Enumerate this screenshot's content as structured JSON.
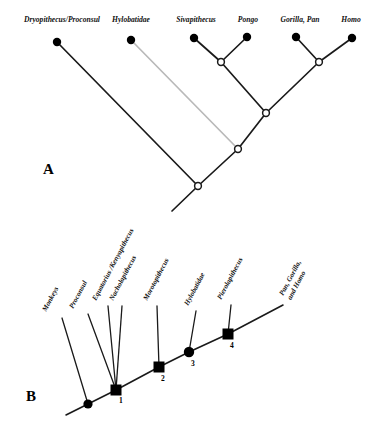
{
  "figure": {
    "background": "#ffffff",
    "branch_color": "#1a1a1a",
    "faded_branch_color": "#b9b9b9",
    "node_fill_terminal": "#000000",
    "node_fill_internal": "#ffffff",
    "node_stroke": "#1a1a1a"
  },
  "panel_a": {
    "letter": "A",
    "tips": [
      {
        "label": "Dryopithecus/Proconsul",
        "x": 57,
        "y": 42,
        "label_x": 62,
        "label_y": 22
      },
      {
        "label": "Hylobatidae",
        "x": 131,
        "y": 40,
        "label_x": 131,
        "label_y": 22,
        "faded": true
      },
      {
        "label": "Sivapithecus",
        "x": 194,
        "y": 38,
        "label_x": 196,
        "label_y": 22
      },
      {
        "label": "Pongo",
        "x": 247,
        "y": 37,
        "label_x": 248,
        "label_y": 22
      },
      {
        "label": "Gorilla, Pan",
        "x": 296,
        "y": 37,
        "label_x": 300,
        "label_y": 22
      },
      {
        "label": "Homo",
        "x": 352,
        "y": 38,
        "label_x": 351,
        "label_y": 22
      }
    ],
    "internal_nodes": [
      {
        "name": "sivapithecus-pongo-node",
        "x": 221,
        "y": 62
      },
      {
        "name": "gorilla-pan-homo-node",
        "x": 319,
        "y": 62
      },
      {
        "name": "great-ape-node",
        "x": 266,
        "y": 113
      },
      {
        "name": "hominoid-node",
        "x": 238,
        "y": 149
      },
      {
        "name": "root-node",
        "x": 198,
        "y": 186
      }
    ],
    "root_stem": {
      "x1": 198,
      "y1": 186,
      "x2": 172,
      "y2": 211
    }
  },
  "panel_b": {
    "letter": "B",
    "tips": [
      {
        "label": "Monkeys",
        "lines": [
          "Monkeys"
        ],
        "label_x": 46,
        "label_y": 312,
        "branch_x": 62,
        "branch_y": 318
      },
      {
        "label": "Proconsul",
        "lines": [
          "Proconsul"
        ],
        "label_x": 72,
        "label_y": 308,
        "branch_x": 88,
        "branch_y": 314
      },
      {
        "label": "Equatorius /Kenyapithecus",
        "lines": [
          "Equatorius /Kenyapithecus"
        ],
        "label_x": 96,
        "label_y": 300,
        "branch_x": 108,
        "branch_y": 306
      },
      {
        "label": "Nacholapithecus",
        "lines": [
          "Nacholapithecus"
        ],
        "label_x": 112,
        "label_y": 300,
        "branch_x": 122,
        "branch_y": 306
      },
      {
        "label": "Morotopithecus",
        "lines": [
          "Morotopithecus"
        ],
        "label_x": 146,
        "label_y": 300,
        "branch_x": 157,
        "branch_y": 306
      },
      {
        "label": "Hylobatidae",
        "lines": [
          "Hylobatidae"
        ],
        "label_x": 186,
        "label_y": 305,
        "branch_x": 196,
        "branch_y": 311
      },
      {
        "label": "Pierolapithecus",
        "lines": [
          "Pierolapithecus"
        ],
        "label_x": 220,
        "label_y": 299,
        "branch_x": 231,
        "branch_y": 305
      },
      {
        "label": "Pan, Gorilla, and Homo",
        "lines": [
          "Pan, Gorilla,",
          "and Homo"
        ],
        "label_x": 281,
        "label_y": 292
      }
    ],
    "numbered_nodes": [
      {
        "number": "1",
        "shape": "square",
        "x": 116,
        "y": 390,
        "num_x": 119,
        "num_y": 402
      },
      {
        "number": "2",
        "shape": "square",
        "x": 159,
        "y": 367,
        "num_x": 161,
        "num_y": 380
      },
      {
        "number": "3",
        "shape": "circle",
        "x": 189,
        "y": 352,
        "num_x": 191,
        "num_y": 365
      },
      {
        "number": "4",
        "shape": "square",
        "x": 228,
        "y": 334,
        "num_x": 230,
        "num_y": 347
      }
    ],
    "base_node": {
      "name": "monkey-divergence-node",
      "shape": "circle",
      "x": 88,
      "y": 404
    },
    "root_stem": {
      "x1": 88,
      "y1": 404,
      "x2": 66,
      "y2": 415
    },
    "spine_end": {
      "x": 283,
      "y": 305
    }
  }
}
